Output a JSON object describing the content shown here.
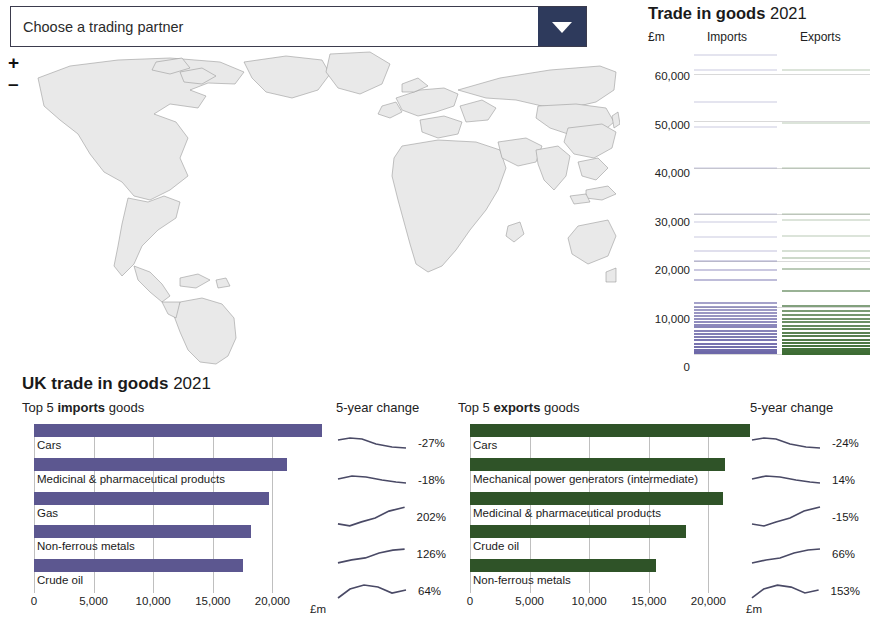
{
  "map_panel": {
    "dropdown": {
      "value": "Choose a trading partner",
      "arrow_icon": "chevron-down-icon"
    },
    "zoom_in": "+",
    "zoom_out": "–",
    "land_color": "#e9e9e9",
    "border_color": "#9a9a9a"
  },
  "strip_chart": {
    "title_bold": "Trade in goods",
    "title_year": "2021",
    "unit": "£m",
    "header_imports": "Imports",
    "header_exports": "Exports",
    "imports_color": "#6c67a8",
    "exports_color": "#3c6b33"
  },
  "bottom": {
    "title_bold": "UK trade in goods",
    "title_year": "2021",
    "unit": "£m",
    "change_header": "5-year change",
    "imports": {
      "sub_pre": "Top 5 ",
      "sub_bold": "imports",
      "sub_post": " goods",
      "color": "#5c5790"
    },
    "exports": {
      "sub_pre": "Top 5 ",
      "sub_bold": "exports",
      "sub_post": " goods",
      "color": "#2f5328"
    }
  },
  "chart_data": [
    {
      "type": "bar",
      "title": "Top 5 imports goods",
      "orientation": "horizontal",
      "categories": [
        "Cars",
        "Medicinal & pharmaceutical products",
        "Gas",
        "Non-ferrous metals",
        "Crude oil"
      ],
      "values": [
        24200,
        21200,
        19700,
        18200,
        17500
      ],
      "changes": [
        "-27%",
        "-18%",
        "202%",
        "126%",
        "64%"
      ],
      "xlabel": "£m",
      "ylabel": "",
      "xlim": [
        0,
        25000
      ],
      "xticks": [
        0,
        5000,
        10000,
        15000,
        20000
      ],
      "xticklabels": [
        "0",
        "5,000",
        "10,000",
        "15,000",
        "20,000"
      ],
      "color": "#5c5790",
      "grid": true,
      "legend": "none"
    },
    {
      "type": "bar",
      "title": "Top 5 exports goods",
      "orientation": "horizontal",
      "categories": [
        "Cars",
        "Mechanical power generators (intermediate)",
        "Medicinal & pharmaceutical products",
        "Crude oil",
        "Non-ferrous metals"
      ],
      "values": [
        23500,
        21400,
        21200,
        18100,
        15600
      ],
      "changes": [
        "-24%",
        "14%",
        "-15%",
        "66%",
        "153%"
      ],
      "xlabel": "£m",
      "ylabel": "",
      "xlim": [
        0,
        25000
      ],
      "xticks": [
        0,
        5000,
        10000,
        15000,
        20000
      ],
      "xticklabels": [
        "0",
        "5,000",
        "10,000",
        "15,000",
        "20,000"
      ],
      "color": "#2f5328",
      "grid": true,
      "legend": "none"
    },
    {
      "type": "bar",
      "title": "Trade in goods 2021",
      "orientation": "horizontal-strip",
      "ylabel": "£m",
      "ylim": [
        0,
        65000
      ],
      "yticks": [
        0,
        10000,
        20000,
        30000,
        40000,
        50000,
        60000
      ],
      "yticklabels": [
        "0",
        "10,000",
        "20,000",
        "30,000",
        "40,000",
        "50,000",
        "60,000"
      ],
      "series": [
        {
          "name": "Imports",
          "color": "#6c67a8",
          "values": [
            64200,
            61000,
            54000,
            48800,
            40000,
            30000,
            28400,
            25000,
            22200,
            20000,
            18000,
            15800,
            11000,
            10100,
            9400,
            8700,
            8100,
            7500,
            6900,
            6300,
            5700,
            5000,
            4300,
            3600,
            2900,
            2200,
            1500,
            900,
            400,
            150
          ]
        },
        {
          "name": "Exports",
          "color": "#3c6b33",
          "values": [
            61000,
            49500,
            40000,
            30000,
            28800,
            25300,
            22200,
            20600,
            18200,
            13500,
            10200,
            9300,
            8400,
            7600,
            6800,
            6000,
            5300,
            4500,
            3800,
            3100,
            2400,
            1700,
            1100,
            600,
            250,
            100
          ]
        }
      ]
    }
  ]
}
